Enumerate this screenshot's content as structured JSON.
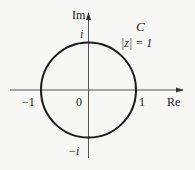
{
  "diagram": {
    "axes": {
      "x_label": "Re",
      "y_label": "Im"
    },
    "tick_labels": {
      "origin": "0",
      "pos_real": "1",
      "neg_real": "−1",
      "pos_imag": "i",
      "neg_imag": "−i"
    },
    "curve": {
      "name": "C",
      "equation": "|z| = 1",
      "color": "#1a1a1a"
    },
    "colors": {
      "axis": "#555555",
      "background": "#f7f7f5"
    }
  }
}
